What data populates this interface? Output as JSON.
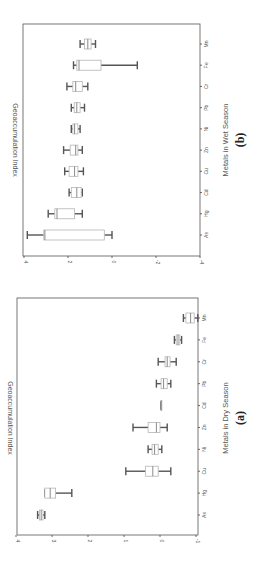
{
  "figure": {
    "orientation": "rotated-90-clockwise",
    "panels": [
      {
        "id": "a",
        "letter": "(a)",
        "xlabel": "Metals in Dry Season",
        "ylabel": "Geoaccumulation Index"
      },
      {
        "id": "b",
        "letter": "(b)",
        "xlabel": "Metals in Wet Season",
        "ylabel": "Geoaccumulation Index"
      }
    ]
  },
  "chart_data": [
    {
      "type": "box",
      "title": "",
      "panel_label": "(a)",
      "xlabel": "Metals in Dry Season",
      "ylabel": "Geoaccumulation Index",
      "ylim": [
        -1,
        4
      ],
      "yticks": [
        4,
        3,
        2,
        1,
        0,
        -1
      ],
      "categories": [
        "As",
        "Hg",
        "Cu",
        "Ni",
        "Zn",
        "Cd",
        "Pb",
        "Cr",
        "Fe",
        "Mn"
      ],
      "boxes": [
        {
          "name": "As",
          "min": 3.2,
          "q1": 3.25,
          "median": 3.3,
          "q3": 3.35,
          "max": 3.4
        },
        {
          "name": "Hg",
          "min": 2.45,
          "q1": 2.9,
          "median": 3.05,
          "q3": 3.2,
          "max": 3.2
        },
        {
          "name": "Cu",
          "min": -0.3,
          "q1": 0.05,
          "median": 0.2,
          "q3": 0.4,
          "max": 0.95
        },
        {
          "name": "Ni",
          "min": -0.05,
          "q1": 0.05,
          "median": 0.15,
          "q3": 0.22,
          "max": 0.33
        },
        {
          "name": "Zn",
          "min": -0.2,
          "q1": 0.0,
          "median": 0.1,
          "q3": 0.33,
          "max": 0.75
        },
        {
          "name": "Cd",
          "min": -0.03,
          "q1": -0.03,
          "median": -0.03,
          "q3": -0.03,
          "max": -0.03
        },
        {
          "name": "Pb",
          "min": -0.3,
          "q1": -0.2,
          "median": -0.1,
          "q3": -0.03,
          "max": 0.1
        },
        {
          "name": "Cr",
          "min": -0.45,
          "q1": -0.28,
          "median": -0.2,
          "q3": -0.14,
          "max": 0.05
        },
        {
          "name": "Fe",
          "min": -0.6,
          "q1": -0.55,
          "median": -0.5,
          "q3": -0.45,
          "max": -0.4
        },
        {
          "name": "Mn",
          "min": -1.05,
          "q1": -0.95,
          "median": -0.85,
          "q3": -0.72,
          "max": -0.65
        }
      ],
      "grid": false,
      "legend": null
    },
    {
      "type": "box",
      "title": "",
      "panel_label": "(b)",
      "xlabel": "Metals in Wet Season",
      "ylabel": "Geoaccumulation Index",
      "ylim": [
        -4,
        4
      ],
      "yticks": [
        4,
        2,
        0,
        -2,
        -4
      ],
      "categories": [
        "As",
        "Hg",
        "Cd",
        "Cu",
        "Zn",
        "Ni",
        "Pb",
        "Cr",
        "Fe",
        "Mn"
      ],
      "boxes": [
        {
          "name": "As",
          "min": 0.0,
          "q1": 0.35,
          "median": 3.05,
          "q3": 3.1,
          "max": 3.85
        },
        {
          "name": "Hg",
          "min": 1.35,
          "q1": 1.7,
          "median": 2.5,
          "q3": 2.6,
          "max": 2.9
        },
        {
          "name": "Cd",
          "min": 1.35,
          "q1": 1.4,
          "median": 1.6,
          "q3": 1.85,
          "max": 1.95
        },
        {
          "name": "Cu",
          "min": 1.3,
          "q1": 1.55,
          "median": 1.7,
          "q3": 1.95,
          "max": 2.15
        },
        {
          "name": "Zn",
          "min": 1.35,
          "q1": 1.55,
          "median": 1.65,
          "q3": 1.9,
          "max": 2.2
        },
        {
          "name": "Ni",
          "min": 1.45,
          "q1": 1.55,
          "median": 1.7,
          "q3": 1.78,
          "max": 1.85
        },
        {
          "name": "Pb",
          "min": 1.25,
          "q1": 1.45,
          "median": 1.6,
          "q3": 1.72,
          "max": 1.85
        },
        {
          "name": "Cr",
          "min": 1.1,
          "q1": 1.35,
          "median": 1.65,
          "q3": 1.78,
          "max": 2.05
        },
        {
          "name": "Fe",
          "min": -1.15,
          "q1": 0.5,
          "median": 1.5,
          "q3": 1.6,
          "max": 1.75
        },
        {
          "name": "Mn",
          "min": 0.75,
          "q1": 0.95,
          "median": 1.1,
          "q3": 1.25,
          "max": 1.45
        }
      ],
      "grid": false,
      "legend": null
    }
  ],
  "colors": {
    "box_stroke": "#b5b5b5",
    "box_fill": "#ffffff",
    "whisker": "#555555",
    "median": "#8a8a8a",
    "axis": "#444444",
    "text": "#555555"
  }
}
